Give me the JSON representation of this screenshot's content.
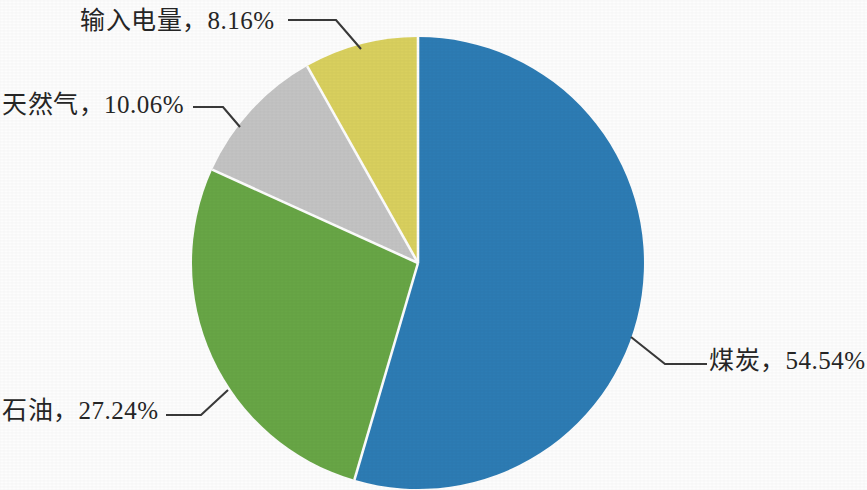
{
  "chart_data": {
    "type": "pie",
    "title": "",
    "subtitle": "",
    "xlabel": "",
    "ylabel": "",
    "legend_position": "none",
    "grid": false,
    "start_angle_deg": 0,
    "direction": "clockwise",
    "unit": "%",
    "categories": [
      "煤炭",
      "石油",
      "天然气",
      "输入电量"
    ],
    "values": [
      54.54,
      27.24,
      10.06,
      8.16
    ],
    "colors": [
      "#2d7cb4",
      "#68a646",
      "#c3c3c3",
      "#d9d05e"
    ],
    "slices": [
      {
        "name": "煤炭",
        "value": 54.54,
        "value_text": "54.54%",
        "label": "煤炭，54.54%",
        "color": "#2d7cb4",
        "label_position": "right"
      },
      {
        "name": "石油",
        "value": 27.24,
        "value_text": "27.24%",
        "label": "石油，27.24%",
        "color": "#68a646",
        "label_position": "bottom-left"
      },
      {
        "name": "天然气",
        "value": 10.06,
        "value_text": "10.06%",
        "label": "天然气，10.06%",
        "color": "#c3c3c3",
        "label_position": "left"
      },
      {
        "name": "输入电量",
        "value": 8.16,
        "value_text": "8.16%",
        "label": "输入电量，8.16%",
        "color": "#d9d05e",
        "label_position": "top-left"
      }
    ]
  },
  "labels": {
    "power": "输入电量，8.16%",
    "gas": "天然气，10.06%",
    "oil": "石油，27.24%",
    "coal": "煤炭，54.54%"
  },
  "colors": {
    "coal": "#2d7cb4",
    "oil": "#68a646",
    "gas": "#c3c3c3",
    "power": "#d9d05e",
    "background": "#fdfdfd",
    "text": "#262626",
    "leader_line": "#3a3a3a",
    "separator": "#fdfdfd"
  },
  "geometry": {
    "center_x": 418,
    "center_y": 263,
    "radius": 226
  }
}
